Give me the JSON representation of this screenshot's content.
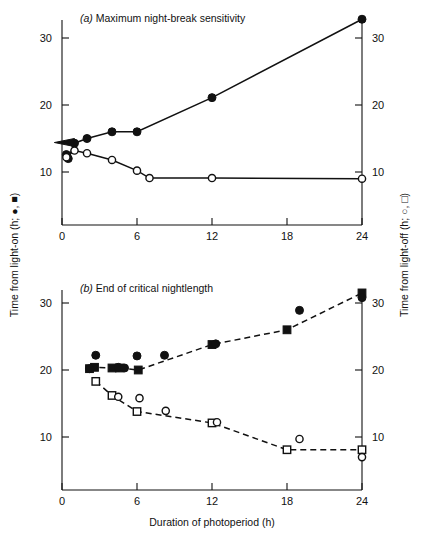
{
  "figure": {
    "width": 422,
    "height": 541,
    "background": "#ffffff",
    "ink_color": "#111111"
  },
  "axis_titles": {
    "left": "Time from light-on (h; ●, ■)",
    "right": "Time from light-off (h; ○, □)",
    "bottom": "Duration of photoperiod (h)"
  },
  "chart_data": [
    {
      "type": "scatter",
      "panel": "a",
      "panel_letter": "a",
      "title": "Maximum night-break sensitivity",
      "title_full": "(a)  Maximum night-break sensitivity",
      "xlabel": "",
      "ylabel": "Time from light-on (h; ●, ■)",
      "ylabel_right": "Time from light-off (h; ○, □)",
      "xlim": [
        0,
        24
      ],
      "ylim": [
        0,
        35
      ],
      "xticks": [
        0,
        6,
        12,
        18,
        24
      ],
      "xticklabels": [
        "0",
        "6",
        "12",
        "18",
        "24"
      ],
      "yticks": [
        10,
        20,
        30
      ],
      "yticklabels": [
        "10",
        "20",
        "30"
      ],
      "yticks_right": [
        10,
        20,
        30
      ],
      "yticklabels_right": [
        "10",
        "20",
        "30"
      ],
      "grid": false,
      "legend": "none",
      "annotations": [
        {
          "kind": "arrow",
          "direction": "left",
          "x": 0.35,
          "y": 14.4
        }
      ],
      "series": [
        {
          "name": "Time from light-on (filled circles)",
          "marker": "filled-circle",
          "linestyle": "solid",
          "x": [
            0.35,
            0.5,
            1.0,
            2.0,
            4.0,
            6.0,
            12.0,
            24.0
          ],
          "y": [
            12.6,
            12.0,
            14.3,
            15.0,
            16.0,
            16.0,
            21.1,
            32.8
          ]
        },
        {
          "name": "Time from light-off (open circles)",
          "marker": "open-circle",
          "linestyle": "solid",
          "x": [
            0.35,
            1.0,
            2.0,
            4.0,
            6.0,
            7.0,
            12.0,
            24.0
          ],
          "y": [
            12.2,
            13.2,
            12.8,
            11.8,
            10.2,
            9.1,
            9.1,
            9.0
          ]
        }
      ]
    },
    {
      "type": "scatter",
      "panel": "b",
      "panel_letter": "b",
      "title": "End of critical nightlength",
      "title_full": "(b)  End of critical nightlength",
      "xlabel": "Duration of photoperiod (h)",
      "ylabel": "Time from light-on (h; ●, ■)",
      "ylabel_right": "Time from light-off (h; ○, □)",
      "xlim": [
        0,
        24
      ],
      "ylim": [
        0,
        35
      ],
      "xticks": [
        0,
        6,
        12,
        18,
        24
      ],
      "xticklabels": [
        "0",
        "6",
        "12",
        "18",
        "24"
      ],
      "yticks": [
        10,
        20,
        30
      ],
      "yticklabels": [
        "10",
        "20",
        "30"
      ],
      "yticks_right": [
        10,
        20,
        30
      ],
      "yticklabels_right": [
        "10",
        "20",
        "30"
      ],
      "grid": false,
      "legend": "none",
      "annotations": [],
      "series": [
        {
          "name": "Time from light-on (filled squares, fitted)",
          "marker": "filled-square",
          "linestyle": "dashed",
          "x": [
            2.2,
            2.6,
            4.0,
            4.6,
            6.1,
            12.0,
            18.0,
            24.0
          ],
          "y": [
            20.2,
            20.4,
            20.3,
            20.3,
            20.0,
            23.8,
            26.0,
            31.5
          ]
        },
        {
          "name": "Time from light-on (filled circles, observed)",
          "marker": "filled-circle",
          "linestyle": "none",
          "x": [
            2.2,
            2.7,
            4.5,
            5.0,
            6.0,
            8.2,
            12.3,
            19.0,
            24.0
          ],
          "y": [
            20.2,
            22.2,
            20.4,
            20.3,
            22.1,
            22.2,
            23.9,
            28.9,
            30.8
          ]
        },
        {
          "name": "Time from light-off (open squares, fitted)",
          "marker": "open-square",
          "linestyle": "dashed",
          "x": [
            2.7,
            4.0,
            6.0,
            12.0,
            18.0,
            24.0
          ],
          "y": [
            18.3,
            16.2,
            13.8,
            12.1,
            8.1,
            8.1
          ]
        },
        {
          "name": "Time from light-off (open circles, observed)",
          "marker": "open-circle",
          "linestyle": "none",
          "x": [
            4.5,
            6.2,
            8.3,
            12.4,
            19.0,
            24.0
          ],
          "y": [
            16.0,
            15.8,
            13.9,
            12.2,
            9.7,
            7.0
          ]
        }
      ]
    }
  ]
}
